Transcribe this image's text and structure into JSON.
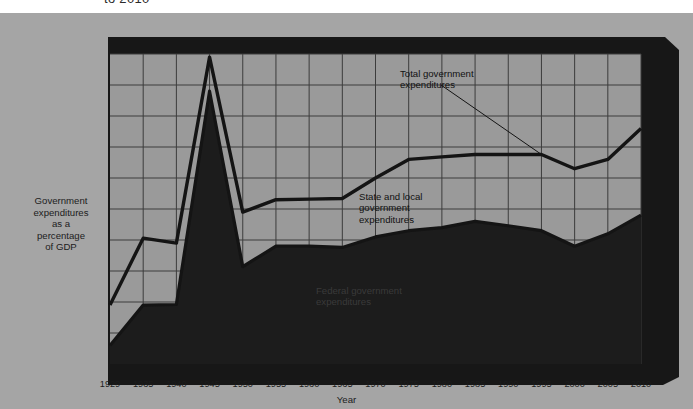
{
  "figure": {
    "partial_title": "to 2010",
    "panel_color": "#a5a5a5",
    "plot_bg_color": "#9a9a9a",
    "frame_color": "#171717",
    "area_fill_color": "#1c1c1c",
    "line_color": "#141414",
    "grid_color": "#3c3c3c"
  },
  "y_axis": {
    "caption": "Government expenditures as a percentage of GDP",
    "caption_lines": [
      "Government",
      "expenditures",
      "as a",
      "percentage",
      "of GDP"
    ],
    "ticks": [
      0,
      5,
      10,
      15,
      20,
      25,
      30,
      35,
      40,
      45,
      50
    ],
    "min": 0,
    "max": 50
  },
  "x_axis": {
    "title": "Year",
    "ticks": [
      "1929",
      "1935",
      "1940",
      "1945",
      "1950",
      "1955",
      "1960",
      "1965",
      "1970",
      "1975",
      "1980",
      "1985",
      "1990",
      "1995",
      "2000",
      "2005",
      "2010"
    ]
  },
  "annotations": [
    {
      "id": "total",
      "text": "Total government\nexpenditures",
      "has_leader_line": true
    },
    {
      "id": "state-local",
      "text": "State and local\ngovernment\nexpenditures",
      "has_leader_line": false
    },
    {
      "id": "federal",
      "text": "Federal government\nexpenditures",
      "has_leader_line": false
    }
  ],
  "chart_data": {
    "type": "area",
    "xlabel": "Year",
    "ylabel": "Government expenditures as a percentage of GDP",
    "xlim": [
      1929,
      2010
    ],
    "ylim": [
      0,
      50
    ],
    "ytick_step": 5,
    "grid": true,
    "legend": "inline-annotations",
    "categories": [
      1929,
      1935,
      1940,
      1945,
      1950,
      1955,
      1960,
      1965,
      1970,
      1975,
      1980,
      1985,
      1990,
      1995,
      2000,
      2005,
      2010
    ],
    "series": [
      {
        "name": "Total government expenditures",
        "style": "line",
        "values": [
          9.5,
          20.3,
          19.5,
          49.5,
          24.5,
          26.5,
          26.6,
          26.7,
          30.0,
          33.0,
          33.4,
          33.8,
          33.8,
          33.8,
          31.5,
          33.0,
          38.0
        ]
      },
      {
        "name": "Federal government expenditures",
        "style": "filled-area",
        "values": [
          3.0,
          9.5,
          9.6,
          44.0,
          15.7,
          19.0,
          19.0,
          18.8,
          20.5,
          21.5,
          22.0,
          23.0,
          22.3,
          21.5,
          19.0,
          21.0,
          24.0
        ]
      },
      {
        "name": "State and local government expenditures",
        "style": "band-between",
        "description": "Region between the federal area and the total line"
      }
    ]
  }
}
